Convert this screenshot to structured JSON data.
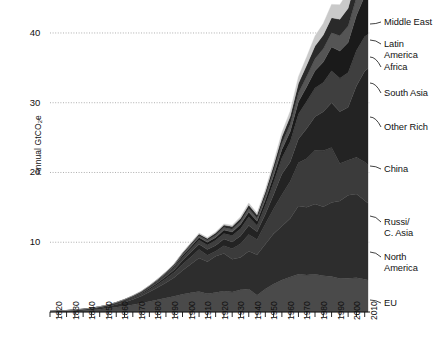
{
  "chart_data": {
    "type": "area",
    "stacked": true,
    "title": "",
    "subtitle": "",
    "xlabel": "",
    "ylabel": "Annual GtCO2e",
    "ylabel_display": "Annual GtCO",
    "ylabel_sub": "2",
    "ylabel_tail": "e",
    "xlim": [
      1820,
      2012
    ],
    "ylim": [
      0,
      41
    ],
    "y_ticks": [
      10,
      20,
      30,
      40
    ],
    "y_tick_labels": [
      "10",
      "20",
      "30",
      "40"
    ],
    "x_ticks": [
      1820,
      1830,
      1840,
      1850,
      1860,
      1870,
      1880,
      1890,
      1900,
      1910,
      1920,
      1930,
      1940,
      1950,
      1960,
      1970,
      1980,
      1990,
      2000,
      2010
    ],
    "x_tick_labels": [
      "1820",
      "1830",
      "1840",
      "1850",
      "1860",
      "1870",
      "1880",
      "1890",
      "1900",
      "1910",
      "1920",
      "1930",
      "1940",
      "1950",
      "1960",
      "1970",
      "1980",
      "1990",
      "2000",
      "2010"
    ],
    "x_minor_tick_step": 5,
    "grid": "horizontal-dotted",
    "legend_position": "right-inline-labels",
    "x": [
      1820,
      1825,
      1830,
      1835,
      1840,
      1845,
      1850,
      1855,
      1860,
      1865,
      1870,
      1875,
      1880,
      1885,
      1890,
      1895,
      1900,
      1905,
      1910,
      1915,
      1920,
      1925,
      1930,
      1935,
      1940,
      1945,
      1950,
      1955,
      1960,
      1965,
      1970,
      1975,
      1980,
      1985,
      1990,
      1995,
      2000,
      2005,
      2010,
      2012
    ],
    "series": [
      {
        "name": "EU",
        "color": "#4a4a4a",
        "values": [
          0.05,
          0.08,
          0.12,
          0.16,
          0.22,
          0.3,
          0.4,
          0.52,
          0.68,
          0.85,
          1.05,
          1.25,
          1.5,
          1.75,
          2.0,
          2.25,
          2.55,
          2.75,
          2.95,
          2.6,
          2.8,
          3.0,
          2.85,
          3.2,
          3.3,
          2.4,
          3.3,
          4.0,
          4.6,
          5.0,
          5.4,
          5.3,
          5.4,
          5.2,
          5.1,
          4.8,
          4.85,
          4.9,
          4.7,
          4.6
        ]
      },
      {
        "name": "North America",
        "color": "#2d2d2d",
        "values": [
          0.02,
          0.03,
          0.05,
          0.07,
          0.1,
          0.14,
          0.2,
          0.28,
          0.4,
          0.55,
          0.75,
          1.0,
          1.35,
          1.75,
          2.2,
          2.7,
          3.4,
          4.1,
          4.8,
          4.6,
          5.2,
          5.4,
          4.7,
          4.6,
          5.4,
          5.8,
          6.4,
          7.2,
          7.7,
          8.4,
          9.8,
          9.7,
          10.1,
          9.9,
          10.6,
          11.1,
          11.9,
          12.0,
          11.3,
          11.0
        ]
      },
      {
        "name": "Russia/C. Asia",
        "color": "#3b3b3b",
        "values": [
          0.01,
          0.01,
          0.02,
          0.02,
          0.03,
          0.04,
          0.06,
          0.08,
          0.11,
          0.15,
          0.2,
          0.26,
          0.34,
          0.44,
          0.56,
          0.7,
          0.9,
          1.05,
          1.2,
          0.95,
          0.7,
          1.1,
          1.5,
          2.0,
          2.4,
          2.2,
          2.9,
          3.6,
          4.5,
          5.3,
          6.2,
          7.0,
          7.7,
          8.0,
          7.9,
          5.4,
          5.0,
          5.3,
          5.5,
          5.5
        ]
      },
      {
        "name": "China",
        "color": "#232323",
        "values": [
          0.01,
          0.01,
          0.01,
          0.02,
          0.02,
          0.03,
          0.04,
          0.05,
          0.07,
          0.09,
          0.12,
          0.15,
          0.2,
          0.26,
          0.33,
          0.42,
          0.55,
          0.65,
          0.75,
          0.8,
          0.85,
          0.95,
          1.0,
          1.1,
          1.3,
          1.1,
          1.4,
          2.0,
          3.0,
          2.8,
          3.4,
          4.3,
          4.8,
          5.6,
          6.4,
          7.4,
          7.6,
          10.2,
          13.0,
          13.8
        ]
      },
      {
        "name": "Other Rich",
        "color": "#3f3f3f",
        "values": [
          0.01,
          0.01,
          0.01,
          0.01,
          0.02,
          0.02,
          0.03,
          0.04,
          0.05,
          0.07,
          0.09,
          0.12,
          0.16,
          0.21,
          0.27,
          0.34,
          0.44,
          0.52,
          0.62,
          0.66,
          0.72,
          0.82,
          0.9,
          1.05,
          1.25,
          0.9,
          1.3,
          1.8,
          2.3,
          2.9,
          3.6,
          3.9,
          4.1,
          4.2,
          4.6,
          4.8,
          5.0,
          5.1,
          5.0,
          4.9
        ]
      },
      {
        "name": "South Asia",
        "color": "#1a1a1a",
        "values": [
          0.0,
          0.0,
          0.01,
          0.01,
          0.01,
          0.01,
          0.02,
          0.02,
          0.03,
          0.04,
          0.05,
          0.07,
          0.09,
          0.12,
          0.15,
          0.19,
          0.25,
          0.3,
          0.35,
          0.38,
          0.42,
          0.48,
          0.52,
          0.58,
          0.68,
          0.6,
          0.75,
          0.95,
          1.2,
          1.45,
          1.75,
          2.1,
          2.5,
          2.95,
          3.4,
          3.9,
          4.3,
          5.0,
          5.8,
          6.1
        ]
      },
      {
        "name": "Africa",
        "color": "#555555",
        "values": [
          0.0,
          0.0,
          0.0,
          0.01,
          0.01,
          0.01,
          0.01,
          0.02,
          0.02,
          0.03,
          0.04,
          0.05,
          0.07,
          0.09,
          0.11,
          0.14,
          0.18,
          0.22,
          0.26,
          0.28,
          0.31,
          0.35,
          0.38,
          0.43,
          0.5,
          0.45,
          0.56,
          0.7,
          0.88,
          1.05,
          1.28,
          1.5,
          1.72,
          1.9,
          2.05,
          2.2,
          2.35,
          2.6,
          2.85,
          2.95
        ]
      },
      {
        "name": "Latin America",
        "color": "#2a2a2a",
        "values": [
          0.0,
          0.0,
          0.0,
          0.01,
          0.01,
          0.01,
          0.01,
          0.02,
          0.02,
          0.03,
          0.04,
          0.05,
          0.07,
          0.09,
          0.11,
          0.14,
          0.18,
          0.22,
          0.26,
          0.28,
          0.32,
          0.36,
          0.4,
          0.45,
          0.52,
          0.48,
          0.6,
          0.76,
          0.95,
          1.12,
          1.36,
          1.6,
          1.8,
          1.95,
          2.15,
          2.35,
          2.55,
          2.8,
          3.0,
          3.1
        ]
      },
      {
        "name": "Middle East",
        "color": "#c9c9c9",
        "values": [
          0.0,
          0.0,
          0.0,
          0.0,
          0.0,
          0.0,
          0.01,
          0.01,
          0.01,
          0.01,
          0.02,
          0.02,
          0.03,
          0.04,
          0.05,
          0.06,
          0.08,
          0.1,
          0.12,
          0.13,
          0.15,
          0.17,
          0.2,
          0.23,
          0.28,
          0.26,
          0.33,
          0.45,
          0.6,
          0.75,
          0.95,
          1.2,
          1.45,
          1.65,
          1.9,
          2.1,
          2.35,
          2.65,
          2.95,
          3.05
        ]
      }
    ],
    "series_labels": [
      {
        "name": "Middle East",
        "text": "Middle East",
        "lines": 1
      },
      {
        "name": "Latin America",
        "text": "Latin\nAmerica",
        "lines": 2
      },
      {
        "name": "Africa",
        "text": "Africa",
        "lines": 1
      },
      {
        "name": "South Asia",
        "text": "South Asia",
        "lines": 1
      },
      {
        "name": "Other Rich",
        "text": "Other Rich",
        "lines": 1
      },
      {
        "name": "China",
        "text": "China",
        "lines": 1
      },
      {
        "name": "Russia/C. Asia",
        "text": "Russi/\nC. Asia",
        "lines": 2
      },
      {
        "name": "North America",
        "text": "North\nAmerica",
        "lines": 2
      },
      {
        "name": "EU",
        "text": "EU",
        "lines": 1
      }
    ]
  }
}
